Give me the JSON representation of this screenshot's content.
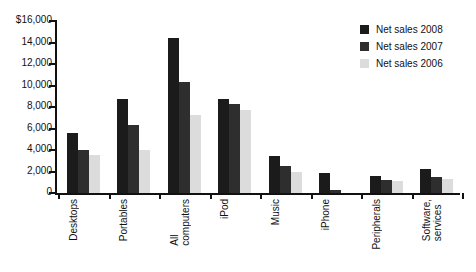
{
  "chart_data": {
    "type": "bar",
    "title": "",
    "subtitle": "",
    "xlabel": "",
    "ylabel": "",
    "ylim": [
      0,
      16000
    ],
    "ytick_values": [
      16000,
      14000,
      12000,
      10000,
      8000,
      6000,
      4000,
      2000,
      0
    ],
    "ytick_labels": [
      "$16,000",
      "14,000",
      "12,000",
      "10,000",
      "8,000",
      "6,000",
      "4,000",
      "2,000",
      "0"
    ],
    "grid": false,
    "legend_position": "top-right",
    "categories": [
      "Desktops",
      "Portables",
      "All computers",
      "iPod",
      "Music",
      "iPhone",
      "Peripherals",
      "Software, services"
    ],
    "category_lines": [
      [
        "Desktops"
      ],
      [
        "Portables"
      ],
      [
        "All",
        "computers"
      ],
      [
        "iPod"
      ],
      [
        "Music"
      ],
      [
        "iPhone"
      ],
      [
        "Peripherals"
      ],
      [
        "Software,",
        "services"
      ]
    ],
    "series": [
      {
        "name": "Net sales 2008",
        "color": "#1b1b1b",
        "values": [
          5600,
          8700,
          14400,
          8700,
          3400,
          1900,
          1600,
          2200
        ]
      },
      {
        "name": "Net sales 2007",
        "color": "#2e2e2e",
        "values": [
          4000,
          6300,
          10300,
          8300,
          2500,
          250,
          1250,
          1500
        ]
      },
      {
        "name": "Net sales 2006",
        "color": "#dcdcdc",
        "values": [
          3500,
          4000,
          7300,
          7700,
          2000,
          0,
          1100,
          1300
        ]
      }
    ]
  },
  "legend": {
    "items": [
      {
        "label": "Net sales 2008",
        "color": "#1b1b1b"
      },
      {
        "label": "Net sales 2007",
        "color": "#2e2e2e"
      },
      {
        "label": "Net sales 2006",
        "color": "#dcdcdc"
      }
    ]
  }
}
